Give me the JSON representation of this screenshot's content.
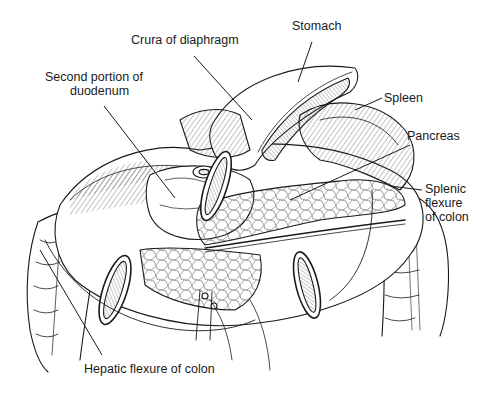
{
  "diagram": {
    "type": "anatomical illustration",
    "labels": [
      {
        "id": "stomach",
        "text": "Stomach",
        "x": 292,
        "y": 26
      },
      {
        "id": "crura",
        "text": "Crura of diaphragm",
        "x": 131,
        "y": 40
      },
      {
        "id": "second-duodenum-1",
        "text": "Second portion of",
        "x": 45,
        "y": 77
      },
      {
        "id": "second-duodenum-2",
        "text": "duodenum",
        "x": 70,
        "y": 91
      },
      {
        "id": "spleen",
        "text": "Spleen",
        "x": 384,
        "y": 90
      },
      {
        "id": "pancreas",
        "text": "Pancreas",
        "x": 407,
        "y": 128
      },
      {
        "id": "splenic-1",
        "text": "Splenic",
        "x": 425,
        "y": 183
      },
      {
        "id": "splenic-2",
        "text": "flexure",
        "x": 425,
        "y": 197
      },
      {
        "id": "splenic-3",
        "text": "of colon",
        "x": 425,
        "y": 211
      },
      {
        "id": "hepatic",
        "text": "Hepatic flexure of colon",
        "x": 84,
        "y": 362
      }
    ],
    "leader_lines": [
      {
        "to": "Stomach",
        "from": [
          312,
          42
        ],
        "end": [
          298,
          82
        ]
      },
      {
        "to": "Crura of diaphragm",
        "from": [
          194,
          56
        ],
        "end": [
          252,
          120
        ]
      },
      {
        "to": "Second portion of duodenum",
        "from": [
          104,
          106
        ],
        "end": [
          175,
          198
        ]
      },
      {
        "to": "Spleen",
        "from": [
          382,
          98
        ],
        "end": [
          355,
          110
        ]
      },
      {
        "to": "Pancreas",
        "from": [
          410,
          145
        ],
        "end": [
          290,
          200
        ]
      },
      {
        "to": "Splenic flexure of colon",
        "from": [
          422,
          190
        ],
        "end": [
          390,
          186
        ]
      },
      {
        "to": "Hepatic flexure of colon",
        "from": [
          102,
          355
        ],
        "end": [
          40,
          250
        ]
      }
    ]
  }
}
